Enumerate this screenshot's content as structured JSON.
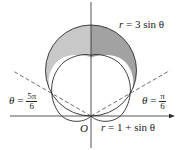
{
  "diagram": {
    "type": "polar-region",
    "curves": [
      {
        "name": "circle",
        "equation_label": "r = 3 sin θ",
        "lhs": "r",
        "rhs": "= 3 sin θ"
      },
      {
        "name": "cardioid",
        "equation_label": "r = 1 + sin θ",
        "lhs": "r",
        "rhs": "= 1 + sin θ"
      }
    ],
    "rays": [
      {
        "label_lhs": "θ",
        "label_eq": " = ",
        "num": "5π",
        "den": "6"
      },
      {
        "label_lhs": "θ",
        "label_eq": " = ",
        "num": "π",
        "den": "6"
      }
    ],
    "origin_label": "O",
    "colors": {
      "shade_left": "#c8c8c8",
      "shade_right": "#a2a2a2",
      "stroke": "#2a2a2a",
      "dashed": "#444444"
    }
  }
}
